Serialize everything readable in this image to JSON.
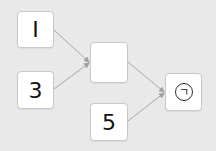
{
  "diagram": {
    "nodes": [
      {
        "id": "a",
        "label": "I",
        "x": 17,
        "y": 11,
        "w": 37,
        "h": 37
      },
      {
        "id": "b",
        "label": "3",
        "x": 17,
        "y": 71,
        "w": 37,
        "h": 38
      },
      {
        "id": "mid",
        "label": "",
        "x": 90,
        "y": 42,
        "w": 38,
        "h": 41
      },
      {
        "id": "c",
        "label": "5",
        "x": 90,
        "y": 103,
        "w": 38,
        "h": 38
      },
      {
        "id": "result",
        "label": "",
        "x": 165,
        "y": 73,
        "w": 37,
        "h": 38,
        "operator_icon": "circled-hook-icon",
        "operator_glyph": "ㄱ"
      }
    ],
    "edges": [
      {
        "from": "a",
        "to": "mid"
      },
      {
        "from": "b",
        "to": "mid"
      },
      {
        "from": "mid",
        "to": "result"
      },
      {
        "from": "c",
        "to": "result"
      }
    ],
    "colors": {
      "background": "#e9e9e9",
      "node": "#ffffff",
      "edge": "#a8a8a8"
    }
  }
}
